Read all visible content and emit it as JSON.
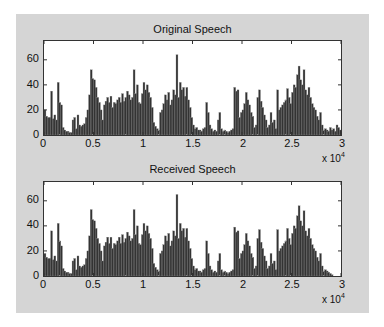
{
  "chart_data": [
    {
      "type": "bar",
      "title": "Original Speech",
      "xlabel": "",
      "ylabel": "",
      "xlim": [
        0,
        30000
      ],
      "ylim": [
        0,
        75
      ],
      "x_multiplier": "x 10^4",
      "xticks": [
        "0",
        "0.5",
        "1",
        "1.5",
        "2",
        "2.5",
        "3"
      ],
      "yticks": [
        "0",
        "20",
        "40",
        "60"
      ],
      "grid": false,
      "bin_width": 200,
      "values": [
        20,
        15,
        14,
        14,
        35,
        13,
        16,
        12,
        42,
        26,
        24,
        6,
        4,
        3,
        3,
        2,
        2,
        12,
        14,
        5,
        16,
        8,
        7,
        8,
        9,
        14,
        20,
        32,
        52,
        45,
        44,
        38,
        30,
        26,
        20,
        12,
        24,
        27,
        30,
        26,
        31,
        22,
        26,
        25,
        28,
        30,
        26,
        33,
        27,
        30,
        35,
        32,
        28,
        30,
        52,
        33,
        40,
        26,
        25,
        33,
        42,
        36,
        40,
        34,
        30,
        22,
        10,
        7,
        5,
        4,
        18,
        20,
        25,
        32,
        28,
        34,
        24,
        28,
        36,
        32,
        64,
        30,
        42,
        36,
        38,
        31,
        38,
        28,
        22,
        14,
        8,
        5,
        6,
        4,
        4,
        3,
        5,
        6,
        26,
        18,
        8,
        5,
        3,
        4,
        3,
        12,
        18,
        5,
        3,
        4,
        3,
        2,
        3,
        4,
        5,
        38,
        35,
        36,
        14,
        18,
        20,
        25,
        34,
        28,
        24,
        18,
        15,
        6,
        8,
        30,
        36,
        27,
        22,
        16,
        12,
        6,
        8,
        18,
        10,
        12,
        5,
        36,
        20,
        22,
        24,
        26,
        28,
        37,
        30,
        25,
        34,
        40,
        38,
        48,
        55,
        44,
        40,
        52,
        36,
        32,
        38,
        30,
        25,
        22,
        20,
        15,
        12,
        18,
        8,
        4,
        5,
        4,
        3,
        6,
        4,
        5,
        3,
        8,
        6,
        4
      ]
    },
    {
      "type": "bar",
      "title": "Received Speech",
      "xlabel": "",
      "ylabel": "",
      "xlim": [
        0,
        30000
      ],
      "ylim": [
        0,
        75
      ],
      "x_multiplier": "x 10^4",
      "xticks": [
        "0",
        "0.5",
        "1",
        "1.5",
        "2",
        "2.5",
        "3"
      ],
      "yticks": [
        "0",
        "20",
        "40",
        "60"
      ],
      "grid": false,
      "bin_width": 200,
      "values": [
        18,
        15,
        14,
        14,
        36,
        13,
        16,
        12,
        42,
        28,
        24,
        6,
        4,
        3,
        3,
        2,
        2,
        12,
        14,
        5,
        16,
        8,
        7,
        8,
        9,
        14,
        20,
        32,
        53,
        45,
        44,
        38,
        30,
        26,
        20,
        12,
        24,
        27,
        31,
        26,
        31,
        22,
        26,
        25,
        28,
        31,
        26,
        33,
        27,
        30,
        35,
        32,
        28,
        30,
        53,
        33,
        40,
        26,
        25,
        33,
        42,
        36,
        40,
        34,
        30,
        22,
        10,
        7,
        5,
        4,
        18,
        20,
        25,
        32,
        28,
        34,
        24,
        28,
        36,
        32,
        65,
        30,
        42,
        36,
        38,
        31,
        38,
        28,
        22,
        14,
        8,
        5,
        6,
        4,
        4,
        3,
        5,
        6,
        28,
        18,
        8,
        5,
        3,
        4,
        3,
        12,
        18,
        5,
        3,
        4,
        3,
        2,
        3,
        4,
        5,
        39,
        35,
        36,
        14,
        18,
        20,
        25,
        34,
        28,
        24,
        18,
        15,
        6,
        8,
        30,
        37,
        27,
        22,
        16,
        12,
        6,
        8,
        18,
        10,
        12,
        5,
        37,
        20,
        22,
        24,
        26,
        28,
        38,
        30,
        25,
        34,
        40,
        38,
        48,
        56,
        44,
        40,
        52,
        36,
        32,
        38,
        30,
        25,
        22,
        20,
        15,
        12,
        18,
        8,
        4,
        5,
        4,
        3,
        2,
        1,
        0,
        0,
        0,
        0,
        0
      ]
    }
  ],
  "plots": [
    {
      "title": "Original Speech",
      "multiplier_base": "x 10",
      "multiplier_exp": "4"
    },
    {
      "title": "Received Speech",
      "multiplier_base": "x 10",
      "multiplier_exp": "4"
    }
  ],
  "axes": {
    "xticks": [
      "0",
      "0.5",
      "1",
      "1.5",
      "2",
      "2.5",
      "3"
    ],
    "yticks": [
      "60",
      "40",
      "20",
      "0"
    ]
  },
  "colors": {
    "bar_fill": "#333333",
    "bar_edge": "#8a8a8a",
    "panel_bg": "#d5d5d5",
    "axes_bg": "#ffffff"
  }
}
